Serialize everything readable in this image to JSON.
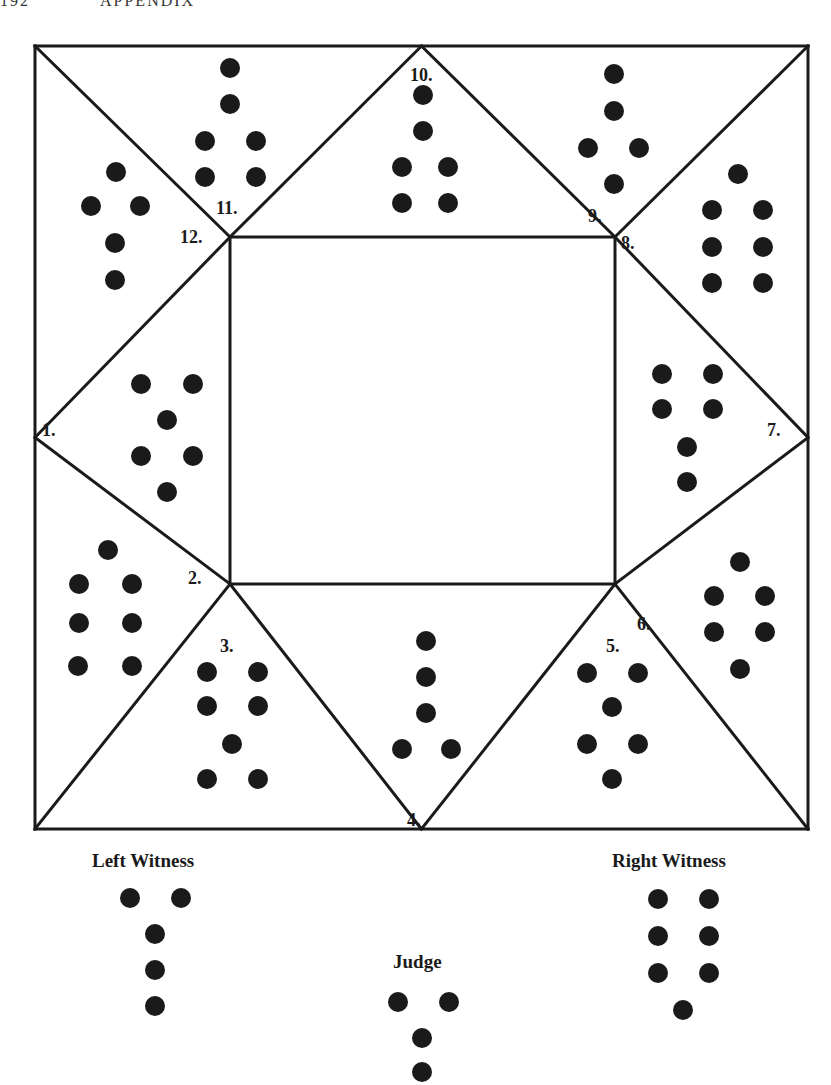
{
  "page_header": {
    "page_number": "192",
    "running_title": "APPENDIX"
  },
  "diagram": {
    "outer_square": {
      "x1": 35,
      "y1": 46,
      "x2": 808,
      "y2": 829
    },
    "inner_square": {
      "x1": 230,
      "y1": 237,
      "x2": 615,
      "y2": 584
    },
    "dot_radius": 10,
    "houses": [
      {
        "number": "1.",
        "label_pos": [
          42,
          436
        ],
        "dots": [
          [
            141,
            384
          ],
          [
            193,
            384
          ],
          [
            167,
            420
          ],
          [
            141,
            456
          ],
          [
            193,
            456
          ],
          [
            167,
            492
          ]
        ]
      },
      {
        "number": "2.",
        "label_pos": [
          188,
          584
        ],
        "dots": [
          [
            108,
            550
          ],
          [
            79,
            584
          ],
          [
            132,
            584
          ],
          [
            79,
            623
          ],
          [
            132,
            623
          ],
          [
            78,
            666
          ],
          [
            132,
            666
          ]
        ]
      },
      {
        "number": "3.",
        "label_pos": [
          220,
          652
        ],
        "dots": [
          [
            207,
            672
          ],
          [
            258,
            672
          ],
          [
            207,
            706
          ],
          [
            258,
            706
          ],
          [
            232,
            744
          ],
          [
            207,
            779
          ],
          [
            258,
            779
          ]
        ]
      },
      {
        "number": "4.",
        "label_pos": [
          407,
          826
        ],
        "dots": [
          [
            426,
            641
          ],
          [
            426,
            677
          ],
          [
            426,
            713
          ],
          [
            402,
            749
          ],
          [
            451,
            749
          ]
        ]
      },
      {
        "number": "5.",
        "label_pos": [
          606,
          652
        ],
        "dots": [
          [
            587,
            673
          ],
          [
            638,
            673
          ],
          [
            612,
            707
          ],
          [
            587,
            744
          ],
          [
            638,
            744
          ],
          [
            612,
            779
          ]
        ]
      },
      {
        "number": "6.",
        "label_pos": [
          637,
          630
        ],
        "dots": [
          [
            740,
            562
          ],
          [
            714,
            596
          ],
          [
            765,
            596
          ],
          [
            714,
            632
          ],
          [
            765,
            632
          ],
          [
            740,
            669
          ]
        ]
      },
      {
        "number": "7.",
        "label_pos": [
          767,
          436
        ],
        "dots": [
          [
            662,
            374
          ],
          [
            713,
            374
          ],
          [
            662,
            409
          ],
          [
            713,
            409
          ],
          [
            687,
            447
          ],
          [
            687,
            482
          ]
        ]
      },
      {
        "number": "8.",
        "label_pos": [
          621,
          249
        ],
        "dots": [
          [
            738,
            174
          ],
          [
            712,
            210
          ],
          [
            763,
            210
          ],
          [
            712,
            247
          ],
          [
            763,
            247
          ],
          [
            712,
            283
          ],
          [
            763,
            283
          ]
        ]
      },
      {
        "number": "9.",
        "label_pos": [
          588,
          222
        ],
        "dots": [
          [
            614,
            74
          ],
          [
            614,
            111
          ],
          [
            588,
            148
          ],
          [
            639,
            148
          ],
          [
            614,
            184
          ]
        ]
      },
      {
        "number": "10.",
        "label_pos": [
          410,
          81
        ],
        "dots": [
          [
            423,
            95
          ],
          [
            423,
            131
          ],
          [
            402,
            167
          ],
          [
            448,
            167
          ],
          [
            402,
            203
          ],
          [
            448,
            203
          ]
        ]
      },
      {
        "number": "11.",
        "label_pos": [
          216,
          214
        ],
        "dots": [
          [
            230,
            68
          ],
          [
            230,
            104
          ],
          [
            205,
            141
          ],
          [
            256,
            141
          ],
          [
            205,
            177
          ],
          [
            256,
            177
          ]
        ]
      },
      {
        "number": "12.",
        "label_pos": [
          180,
          243
        ],
        "dots": [
          [
            116,
            172
          ],
          [
            91,
            206
          ],
          [
            140,
            206
          ],
          [
            115,
            243
          ],
          [
            115,
            280
          ]
        ]
      }
    ],
    "witnesses": [
      {
        "name": "Left Witness",
        "label_pos": [
          92,
          867
        ],
        "dots": [
          [
            130,
            898
          ],
          [
            181,
            898
          ],
          [
            155,
            934
          ],
          [
            155,
            970
          ],
          [
            155,
            1006
          ]
        ]
      },
      {
        "name": "Right Witness",
        "label_pos": [
          612,
          867
        ],
        "dots": [
          [
            658,
            899
          ],
          [
            709,
            899
          ],
          [
            658,
            936
          ],
          [
            709,
            936
          ],
          [
            658,
            973
          ],
          [
            709,
            973
          ],
          [
            683,
            1010
          ]
        ]
      },
      {
        "name": "Judge",
        "label_pos": [
          393,
          968
        ],
        "dots": [
          [
            398,
            1002
          ],
          [
            449,
            1002
          ],
          [
            422,
            1038
          ],
          [
            422,
            1072
          ]
        ]
      }
    ]
  }
}
